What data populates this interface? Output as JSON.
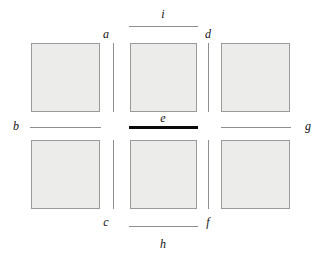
{
  "figure": {
    "title": "",
    "type": "grid-diagram",
    "background_color": "#ffffff",
    "cell_fill_color": "#ececeb",
    "cell_border_color": "#9a9a9a",
    "segment_color": "#8e8e8e",
    "highlight_color": "#0a0a0a",
    "label_color": "#111111"
  },
  "cells": [
    {
      "id": "cell-top-left",
      "row": 0,
      "col": 0
    },
    {
      "id": "cell-top-center",
      "row": 0,
      "col": 1
    },
    {
      "id": "cell-top-right",
      "row": 0,
      "col": 2
    },
    {
      "id": "cell-bottom-left",
      "row": 1,
      "col": 0
    },
    {
      "id": "cell-bottom-center",
      "row": 1,
      "col": 1
    },
    {
      "id": "cell-bottom-right",
      "row": 1,
      "col": 2
    }
  ],
  "segments": [
    {
      "id": "a",
      "label": "a",
      "orientation": "vertical",
      "highlighted": false
    },
    {
      "id": "b",
      "label": "b",
      "orientation": "horizontal",
      "highlighted": false
    },
    {
      "id": "c",
      "label": "c",
      "orientation": "vertical",
      "highlighted": false
    },
    {
      "id": "d",
      "label": "d",
      "orientation": "vertical",
      "highlighted": false
    },
    {
      "id": "e",
      "label": "e",
      "orientation": "horizontal",
      "highlighted": true
    },
    {
      "id": "f",
      "label": "f",
      "orientation": "vertical",
      "highlighted": false
    },
    {
      "id": "g",
      "label": "g",
      "orientation": "horizontal",
      "highlighted": false
    },
    {
      "id": "h",
      "label": "h",
      "orientation": "horizontal",
      "highlighted": false
    },
    {
      "id": "i",
      "label": "i",
      "orientation": "horizontal",
      "highlighted": false
    }
  ],
  "labels": {
    "a": "a",
    "b": "b",
    "c": "c",
    "d": "d",
    "e": "e",
    "f": "f",
    "g": "g",
    "h": "h",
    "i": "i"
  }
}
